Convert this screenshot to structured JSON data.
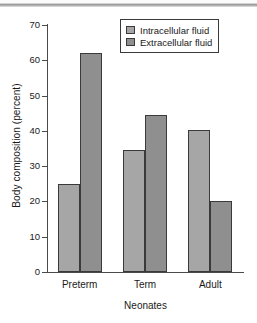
{
  "chart_data": {
    "type": "bar",
    "title": "",
    "subtitle": "",
    "xlabel": "Neonates",
    "ylabel": "Body composition (percent)",
    "categories": [
      "Preterm",
      "Term",
      "Adult"
    ],
    "series": [
      {
        "name": "Intracellular fluid",
        "color": "#a6a6a6",
        "values": [
          25,
          34.7,
          40.2
        ]
      },
      {
        "name": "Extracellular fluid",
        "color": "#8f8f8f",
        "values": [
          62,
          44.6,
          20.1
        ]
      }
    ],
    "ylim": [
      0,
      70
    ],
    "ytick_labels": [
      "70",
      "60",
      "50",
      "40",
      "30",
      "20",
      "10",
      "0"
    ],
    "ytick_values": [
      70,
      60,
      50,
      40,
      30,
      20,
      10,
      0
    ],
    "grid": false,
    "legend_position": "top-right",
    "legend_entries": [
      "Intracellular fluid",
      "Extracellular fluid"
    ],
    "axis_color": "#4a4a4a",
    "bar_edge_color": "#3a3a3a",
    "background_color": "#ffffff"
  }
}
